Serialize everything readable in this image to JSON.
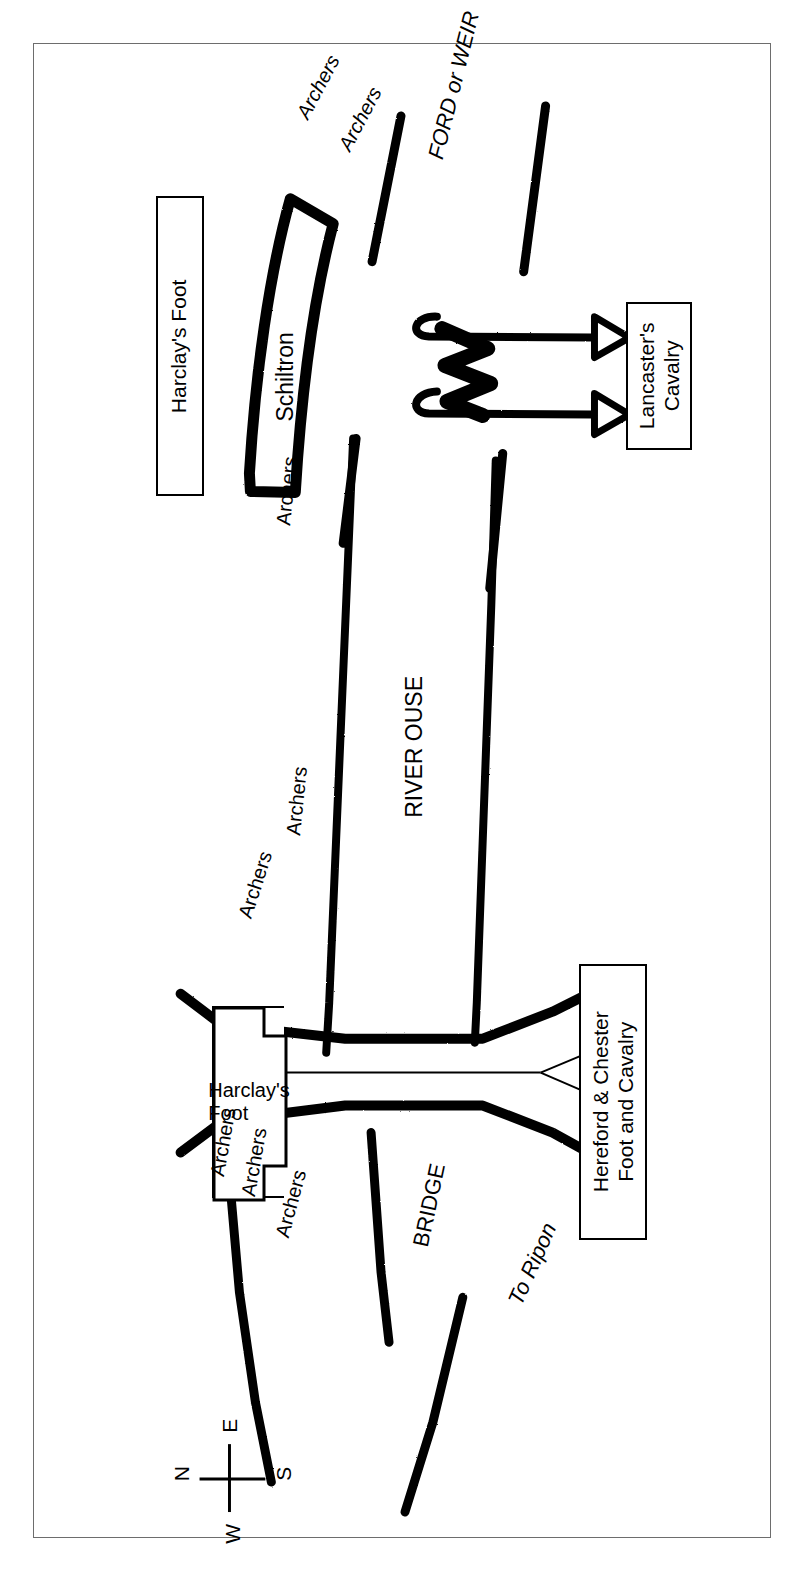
{
  "map": {
    "title": "Battle of Boroughbridge battle map",
    "background_color": "#ffffff",
    "frame_color": "#6d6d6d",
    "ink_color": "#000000"
  },
  "compass": {
    "name": "compass-rose",
    "north": "N",
    "east": "E",
    "south": "S",
    "west": "W"
  },
  "unit_boxes": [
    {
      "id": "harclay-foot-north",
      "label": "Harclay's Foot"
    },
    {
      "id": "lancaster-cavalry",
      "label": "Lancaster's\nCavalry"
    },
    {
      "id": "harclay-foot-bridge",
      "label": "Harclay's\nFoot"
    },
    {
      "id": "hereford-chester",
      "label": "Hereford & Chester\nFoot and Cavalry"
    }
  ],
  "labels": {
    "schiltron": "Schiltron",
    "ford_or_weir": "FORD or WEIR",
    "river_ouse": "RIVER OUSE",
    "bridge": "BRIDGE",
    "to_ripon": "To Ripon",
    "archers": "Archers"
  },
  "archer_markers": [
    {
      "id": "archers-north-1",
      "label": "Archers"
    },
    {
      "id": "archers-north-2",
      "label": "Archers"
    },
    {
      "id": "archers-mid-1",
      "label": "Archers"
    },
    {
      "id": "archers-mid-2",
      "label": "Archers"
    },
    {
      "id": "archers-bridge-1",
      "label": "Archers"
    },
    {
      "id": "archers-bridge-2",
      "label": "Archers"
    },
    {
      "id": "archers-bridge-3",
      "label": "Archers"
    },
    {
      "id": "archers-bridge-4",
      "label": "Archers"
    }
  ]
}
